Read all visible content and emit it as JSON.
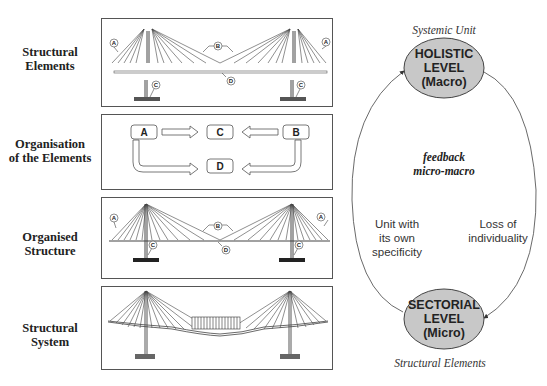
{
  "rows": [
    {
      "label_line1": "Structural",
      "label_line2": "Elements"
    },
    {
      "label_line1": "Organisation",
      "label_line2": "of the Elements"
    },
    {
      "label_line1": "Organised",
      "label_line2": "Structure"
    },
    {
      "label_line1": "Structural",
      "label_line2": "System"
    }
  ],
  "element_labels": {
    "a": "A",
    "b": "B",
    "c": "C",
    "d": "D"
  },
  "organisation": {
    "box_a": "A",
    "box_b": "B",
    "box_c": "C",
    "box_d": "D"
  },
  "cycle": {
    "top_caption": "Systemic Unit",
    "holistic": {
      "line1": "HOLISTIC",
      "line2": "LEVEL",
      "line3": "(Macro)"
    },
    "feedback": {
      "line1": "feedback",
      "line2": "micro-macro"
    },
    "left_text": {
      "line1": "Unit with",
      "line2": "its own",
      "line3": "specificity"
    },
    "right_text": {
      "line1": "Loss of",
      "line2": "individuality"
    },
    "sectorial": {
      "line1": "SECTORIAL",
      "line2": "LEVEL",
      "line3": "(Micro)"
    },
    "bottom_caption": "Structural Elements",
    "ellipse_fill": "#c8c8c8"
  }
}
